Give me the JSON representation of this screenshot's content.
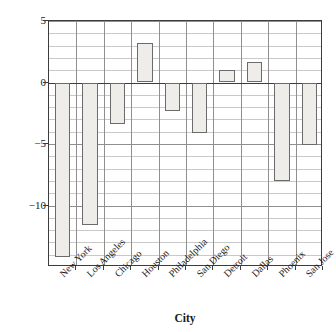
{
  "chart_data": {
    "type": "bar",
    "title": "",
    "subtitle": "",
    "xlabel": "City",
    "ylabel": "Change in crime rate (in percent)",
    "categories": [
      "New York",
      "Los Angeles",
      "Chicago",
      "Houston",
      "Philadelphia",
      "San Diego",
      "Detroit",
      "Dallas",
      "Phoenix",
      "San Jose"
    ],
    "values": [
      -14.2,
      -11.6,
      -3.4,
      3.2,
      -2.3,
      -4.1,
      1.0,
      1.7,
      -8.0,
      -5.1
    ],
    "ylim": [
      -15,
      5
    ],
    "ytick_labels": [
      "5",
      "0",
      "-5",
      "-10"
    ],
    "ytick_values": [
      5,
      0,
      -5,
      -10
    ],
    "minor_gridline_interval": 1,
    "grid": "horizontal-minor-and-major-plus-vertical-category-dividers",
    "legend": "none",
    "bar_fill_color": "#eeedea",
    "bar_edge_color": "#6b6b6b",
    "axis_color": "#3c3c3c",
    "gridline_color": "#c9c9c9",
    "major_gridline_color": "#8f8f8f",
    "annotations": []
  }
}
